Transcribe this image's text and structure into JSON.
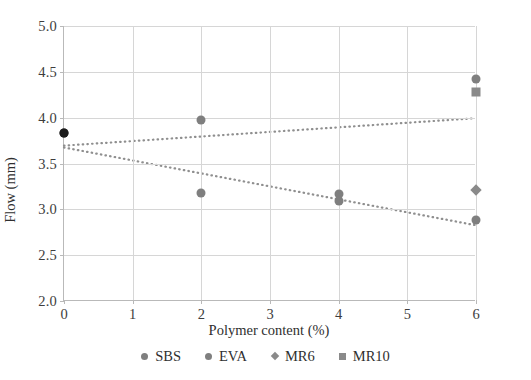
{
  "chart_data": {
    "type": "scatter",
    "title": "",
    "xlabel": "Polymer content (%)",
    "ylabel": "Flow (mm)",
    "xlim": [
      0,
      6
    ],
    "ylim": [
      2.0,
      5.0
    ],
    "xticks": [
      "0",
      "1",
      "2",
      "3",
      "4",
      "5",
      "6"
    ],
    "yticks": [
      "2.0",
      "2.5",
      "3.0",
      "3.5",
      "4.0",
      "4.5",
      "5.0"
    ],
    "grid": true,
    "legend_position": "bottom",
    "series": [
      {
        "name": "SBS",
        "marker": "circle",
        "color": "#7f7f7f",
        "points": [
          {
            "x": 0,
            "y": 3.83
          },
          {
            "x": 2,
            "y": 3.97
          },
          {
            "x": 4,
            "y": 3.17
          },
          {
            "x": 6,
            "y": 4.42
          }
        ]
      },
      {
        "name": "EVA",
        "marker": "circle",
        "color": "#7f7f7f",
        "points": [
          {
            "x": 0,
            "y": 3.83
          },
          {
            "x": 2,
            "y": 3.18
          },
          {
            "x": 4,
            "y": 3.09
          },
          {
            "x": 6,
            "y": 2.88
          }
        ]
      },
      {
        "name": "MR6",
        "marker": "diamond",
        "color": "#8a8a8a",
        "points": [
          {
            "x": 6,
            "y": 3.21
          }
        ]
      },
      {
        "name": "MR10",
        "marker": "square",
        "color": "#8a8a8a",
        "points": [
          {
            "x": 6,
            "y": 4.28
          }
        ]
      }
    ],
    "trendlines": [
      {
        "name": "SBS-trend",
        "style": "dotted",
        "color": "#8f8f8f",
        "x0": 0,
        "y0": 3.69,
        "x1": 6,
        "y1": 3.99
      },
      {
        "name": "EVA-trend",
        "style": "dotted",
        "color": "#8f8f8f",
        "x0": 0,
        "y0": 3.67,
        "x1": 6,
        "y1": 2.82
      }
    ]
  },
  "legend": {
    "items": [
      {
        "label": "SBS",
        "marker": "circle"
      },
      {
        "label": "EVA",
        "marker": "circle"
      },
      {
        "label": "MR6",
        "marker": "diamond"
      },
      {
        "label": "MR10",
        "marker": "square"
      }
    ]
  }
}
